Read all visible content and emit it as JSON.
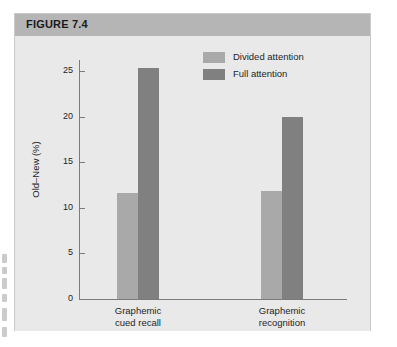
{
  "figure": {
    "header_label": "FIGURE 7.4"
  },
  "chart_data": {
    "type": "bar",
    "title": "",
    "xlabel": "",
    "ylabel": "Old–New (%)",
    "ylim": [
      0,
      27
    ],
    "yticks": [
      0,
      5,
      10,
      15,
      20,
      25
    ],
    "ytick_labels": [
      "0",
      "5",
      "10",
      "15",
      "20",
      "25"
    ],
    "grid": false,
    "legend_position": "top-right",
    "categories": [
      "Graphemic cued recall",
      "Graphemic recognition"
    ],
    "category_lines": [
      [
        "Graphemic",
        "cued recall"
      ],
      [
        "Graphemic",
        "recognition"
      ]
    ],
    "series": [
      {
        "name": "Divided attention",
        "color": "#a9a9a9",
        "values": [
          11.6,
          11.8
        ]
      },
      {
        "name": "Full attention",
        "color": "#808080",
        "values": [
          25.3,
          20.0
        ]
      }
    ]
  },
  "colors": {
    "header_band": "#b5b5b5",
    "plot_background": "#e9e9e9",
    "axis": "#7b7b7b",
    "divided_attention": "#a9a9a9",
    "full_attention": "#808080"
  }
}
